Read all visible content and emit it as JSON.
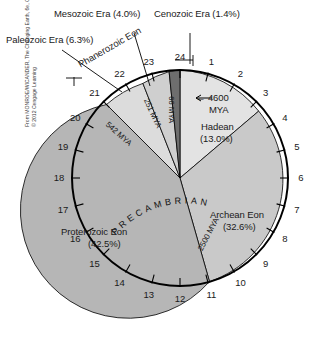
{
  "figure": {
    "credit_line1": "From MONROE/WICANDER, The Changing Earth, 6e, Copyright",
    "credit_line2": "© 2012 Cengage Learning"
  },
  "callouts": {
    "paleozoic": "Paleozoic Era (6.3%)",
    "mesozoic": "Mesozoic Era (4.0%)",
    "cenozoic": "Cenozoic Era (1.4%)",
    "phanerozoic": "Phanerozoic Eon"
  },
  "inner_labels": {
    "hadean_name": "Hadean",
    "hadean_pct": "(13.0%)",
    "archean_name": "Archean Eon",
    "archean_pct": "(32.6%)",
    "proterozoic_name": "Proterozoic Eon",
    "proterozoic_pct": "(42.5%)",
    "precambrian": "PRECAMBRIAN",
    "origin_arrow": "← 4600",
    "origin_unit": "MYA"
  },
  "boundaries": {
    "cenozoic_base": "66 MYA",
    "mesozoic_base": "251 MYA",
    "paleozoic_base": "542 MYA",
    "archean_base": "2500 MYA"
  },
  "hour_ticks": [
    "1",
    "2",
    "3",
    "4",
    "5",
    "6",
    "7",
    "8",
    "9",
    "10",
    "11",
    "12",
    "13",
    "14",
    "15",
    "16",
    "17",
    "18",
    "19",
    "20",
    "21",
    "22",
    "23",
    "24"
  ],
  "colors": {
    "hadean": "#e3e3e3",
    "archean": "#c9c9c9",
    "proterozoic": "#b6b6b6",
    "paleozoic": "#dcdcdc",
    "mesozoic": "#cfcfcf",
    "cenozoic": "#6e6e6e",
    "outline": "#000000",
    "text": "#1a1a1a"
  },
  "chart_data": {
    "type": "pie",
    "categories": [
      "Hadean",
      "Archean Eon",
      "Proterozoic Eon",
      "Paleozoic Era",
      "Mesozoic Era",
      "Cenozoic Era"
    ],
    "values": [
      13.0,
      32.6,
      42.5,
      6.3,
      4.0,
      1.4
    ],
    "unit": "percent of Earth history",
    "total_span_mya": 4600,
    "boundaries_mya": [
      4600,
      2500,
      542,
      251,
      66,
      0
    ],
    "axis_ticks": [
      "1",
      "2",
      "3",
      "4",
      "5",
      "6",
      "7",
      "8",
      "9",
      "10",
      "11",
      "12",
      "13",
      "14",
      "15",
      "16",
      "17",
      "18",
      "19",
      "20",
      "21",
      "22",
      "23",
      "24"
    ],
    "axis_label": "hours (24-hour clock of Earth history)",
    "start_angle_deg": 0,
    "direction": "clockwise",
    "legend": "inline labels",
    "grid": false
  }
}
